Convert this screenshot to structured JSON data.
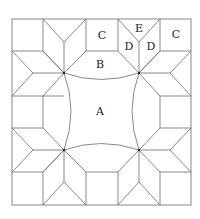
{
  "diagram": {
    "type": "quilt-block-pattern",
    "labels": {
      "A": "A",
      "B": "B",
      "C1": "C",
      "C2": "C",
      "D1": "D",
      "D2": "D",
      "E": "E"
    },
    "colors": {
      "line": "#7a7a7a",
      "text": "#222222",
      "background": "#ffffff"
    }
  }
}
